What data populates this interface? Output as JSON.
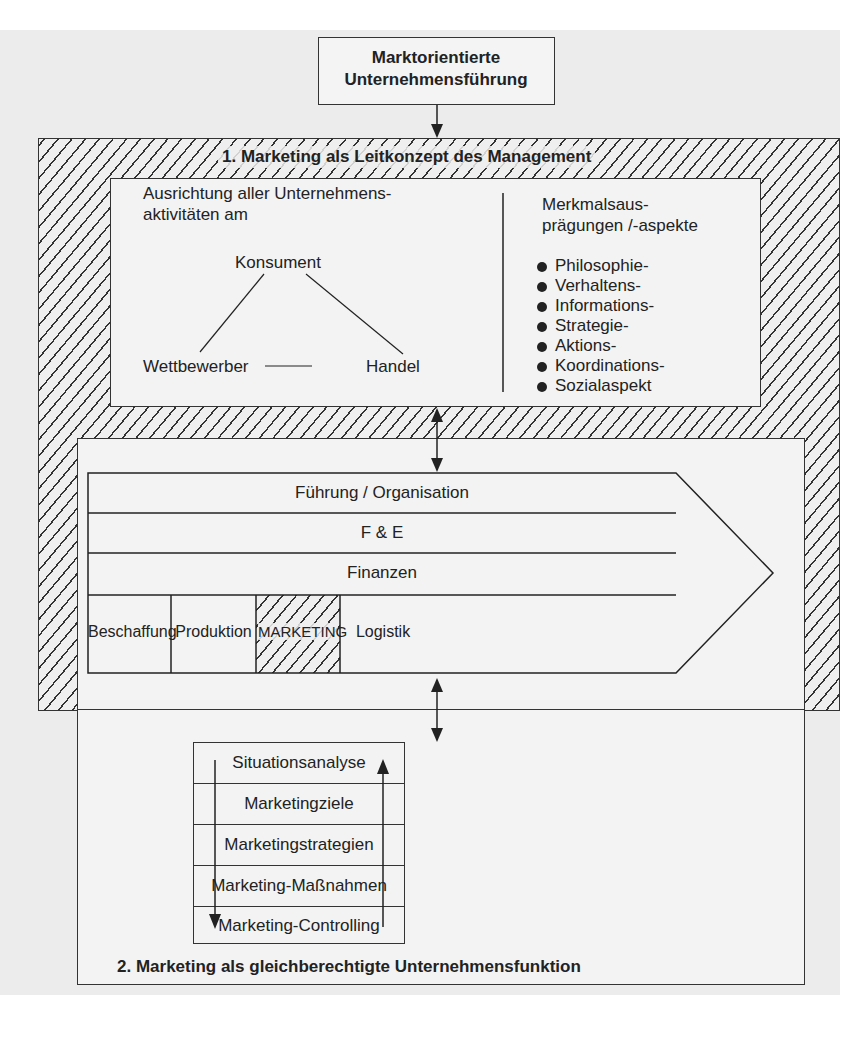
{
  "top_box": {
    "line1": "Marktorientierte",
    "line2": "Unternehmensführung"
  },
  "section1": {
    "title": "1. Marketing als Leitkonzept des Management",
    "left": {
      "line1": "Ausrichtung aller Unternehmens-",
      "line2": "aktivitäten am",
      "triangle": {
        "top": "Konsument",
        "bottom_left": "Wettbewerber",
        "bottom_right": "Handel"
      }
    },
    "right": {
      "heading_line1": "Merkmalsaus-",
      "heading_line2": "prägungen /-aspekte",
      "items": [
        "Philosophie-",
        "Verhaltens-",
        "Informations-",
        "Strategie-",
        "Aktions-",
        "Koordinations-",
        "Sozialaspekt"
      ]
    }
  },
  "value_chain": {
    "rows": [
      "Führung / Organisation",
      "F & E",
      "Finanzen"
    ],
    "functions": [
      "Beschaffung",
      "Produktion",
      "MARKETING",
      "Logistik"
    ]
  },
  "section2": {
    "title": "2. Marketing als gleichberechtigte Unternehmensfunktion",
    "process_steps": [
      "Situationsanalyse",
      "Marketingziele",
      "Marketingstrategien",
      "Marketing-Maßnahmen",
      "Marketing-Controlling"
    ]
  }
}
